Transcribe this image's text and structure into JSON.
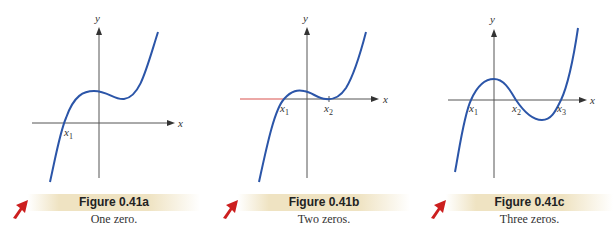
{
  "figures": [
    {
      "id": "a",
      "title": "Figure 0.41a",
      "caption": "One zero.",
      "axis_labels": {
        "x": "x",
        "y": "y"
      },
      "zero_labels": [
        "x1"
      ]
    },
    {
      "id": "b",
      "title": "Figure 0.41b",
      "caption": "Two zeros.",
      "axis_labels": {
        "x": "x",
        "y": "y"
      },
      "zero_labels": [
        "x1",
        "x2"
      ]
    },
    {
      "id": "c",
      "title": "Figure 0.41c",
      "caption": "Three zeros.",
      "axis_labels": {
        "x": "x",
        "y": "y"
      },
      "zero_labels": [
        "x1",
        "x2",
        "x3"
      ]
    }
  ],
  "colors": {
    "curve": "#2b55a8",
    "axis": "#555555",
    "highlight_axis": "#d9534f",
    "caption_bar": "#efe3c2",
    "arrow": "#cc1f1f"
  }
}
